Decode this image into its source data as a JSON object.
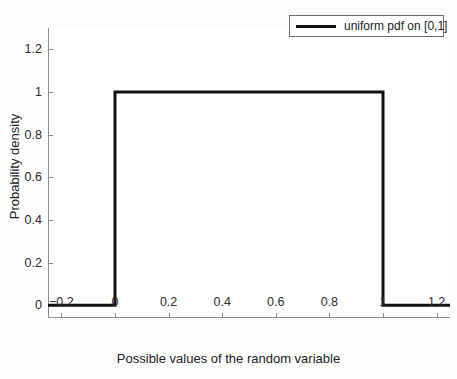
{
  "figure": {
    "background_color": "#fdfdfd",
    "plot_background_color": "#ffffff",
    "axis_color": "#8d8d8d",
    "line_color": "#111111"
  },
  "legend": {
    "entry_label": "uniform pdf on [0,1]",
    "position": "top-right",
    "border_color": "#6e6e6e"
  },
  "axes": {
    "xlabel": "Possible values of the random variable",
    "ylabel": "Probability density",
    "xticks": [
      "-0.2",
      "0",
      "0.2",
      "0.4",
      "0.6",
      "0.8",
      "1",
      "1.2"
    ],
    "xtick_values": [
      -0.2,
      0,
      0.2,
      0.4,
      0.6,
      0.8,
      1,
      1.2
    ],
    "yticks": [
      "0",
      "0.2",
      "0.4",
      "0.6",
      "0.8",
      "1",
      "1.2"
    ],
    "ytick_values": [
      0,
      0.2,
      0.4,
      0.6,
      0.8,
      1,
      1.2
    ]
  },
  "chart_data": {
    "type": "line",
    "title": "",
    "xlabel": "Possible values of the random variable",
    "ylabel": "Probability density",
    "xlim": [
      -0.25,
      1.25
    ],
    "ylim": [
      -0.06,
      1.3
    ],
    "grid": false,
    "legend_position": "upper right",
    "series": [
      {
        "name": "uniform pdf on [0,1]",
        "color": "#111111",
        "linewidth": 3,
        "x": [
          -0.25,
          0.0,
          0.0,
          1.0,
          1.0,
          1.25
        ],
        "y": [
          0,
          0,
          1,
          1,
          0,
          0
        ]
      }
    ],
    "annotations": []
  }
}
